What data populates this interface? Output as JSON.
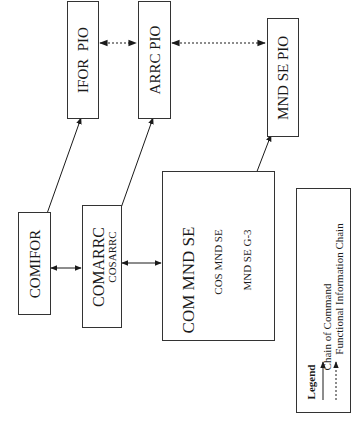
{
  "diagram": {
    "nodes": {
      "ifor_pio": {
        "label": "IFOR  PIO"
      },
      "arrc_pio": {
        "label": "ARRC PIO"
      },
      "mnd_se_pio": {
        "label": "MND SE PIO"
      },
      "comifor": {
        "label": "COMIFOR"
      },
      "comarrc": {
        "label": "COMARRC",
        "sub": "COSARRC"
      },
      "com_mnd_se": {
        "label": "COM MND SE",
        "lines": [
          "COS MND SE",
          "MND SE G-3"
        ]
      }
    },
    "edges": [
      {
        "from": "IFOR PIO",
        "to": "ARRC PIO",
        "type": "functional-information",
        "style": "dotted",
        "bidirectional": true
      },
      {
        "from": "ARRC PIO",
        "to": "MND SE PIO",
        "type": "functional-information",
        "style": "dotted",
        "bidirectional": true
      },
      {
        "from": "COMIFOR",
        "to": "IFOR PIO",
        "type": "chain-of-command",
        "style": "solid",
        "bidirectional": true
      },
      {
        "from": "COMARRC",
        "to": "ARRC PIO",
        "type": "chain-of-command",
        "style": "solid",
        "bidirectional": true
      },
      {
        "from": "COM MND SE",
        "to": "MND SE PIO",
        "type": "chain-of-command",
        "style": "solid",
        "bidirectional": true
      },
      {
        "from": "COMIFOR",
        "to": "COMARRC",
        "type": "chain-of-command",
        "style": "solid",
        "bidirectional": true
      },
      {
        "from": "COMARRC",
        "to": "COM MND SE",
        "type": "chain-of-command",
        "style": "solid",
        "bidirectional": true
      }
    ],
    "legend": {
      "title": "Legend",
      "items": [
        {
          "label": "Chain of Command",
          "style": "solid"
        },
        {
          "label": "Functional Information Chain",
          "style": "dotted"
        }
      ]
    },
    "orientation": "rotated -90deg"
  }
}
